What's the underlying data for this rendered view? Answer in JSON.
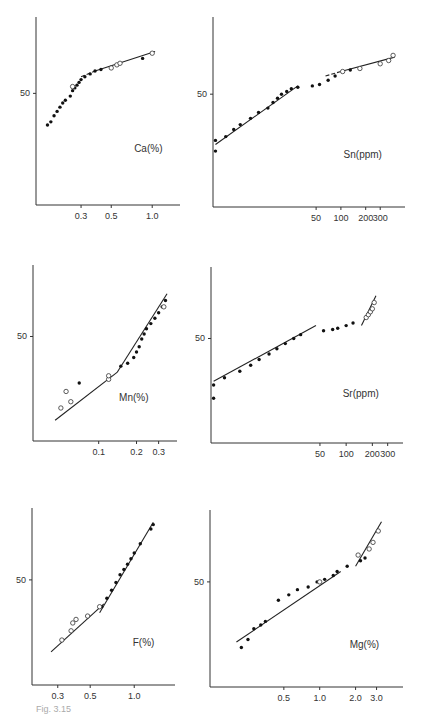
{
  "figure": {
    "caption": "Fig. 3.15"
  },
  "chart_data": [
    {
      "type": "scatter",
      "title": "Ca (%)",
      "label": "Ca(%)",
      "ylabel_tick": "50",
      "xticks": [
        "0.3",
        "0.5",
        "1.0"
      ],
      "xscale": "log",
      "yscale": "probability",
      "points": {
        "filled": [
          [
            0.17,
            28
          ],
          [
            0.18,
            30
          ],
          [
            0.19,
            34
          ],
          [
            0.2,
            37
          ],
          [
            0.21,
            40
          ],
          [
            0.22,
            43
          ],
          [
            0.23,
            45
          ],
          [
            0.25,
            48
          ],
          [
            0.26,
            52
          ],
          [
            0.27,
            54
          ],
          [
            0.28,
            56
          ],
          [
            0.29,
            58
          ],
          [
            0.3,
            60
          ],
          [
            0.32,
            62
          ],
          [
            0.35,
            64
          ],
          [
            0.38,
            66
          ],
          [
            0.42,
            67
          ],
          [
            0.85,
            74
          ]
        ],
        "open": [
          [
            0.26,
            55
          ],
          [
            0.5,
            68
          ],
          [
            0.55,
            70
          ],
          [
            0.58,
            71
          ],
          [
            1.0,
            77
          ]
        ]
      },
      "fit_lines": [
        {
          "from": [
            0.3,
            62
          ],
          "to": [
            0.38,
            66
          ],
          "style": "dashed"
        },
        {
          "from": [
            0.38,
            66
          ],
          "to": [
            1.05,
            78
          ],
          "style": "solid"
        }
      ]
    },
    {
      "type": "scatter",
      "title": "Sn (ppm)",
      "label": "Sn(ppm)",
      "ylabel_tick": "50",
      "xticks": [
        "50",
        "100",
        "200",
        "300"
      ],
      "xscale": "log",
      "yscale": "probability",
      "points": {
        "filled": [
          [
            3,
            15
          ],
          [
            3,
            20
          ],
          [
            4,
            22
          ],
          [
            5,
            26
          ],
          [
            6,
            29
          ],
          [
            8,
            33
          ],
          [
            10,
            37
          ],
          [
            13,
            40
          ],
          [
            15,
            44
          ],
          [
            17,
            47
          ],
          [
            19,
            50
          ],
          [
            22,
            52
          ],
          [
            25,
            54
          ],
          [
            30,
            55
          ],
          [
            45,
            56
          ],
          [
            55,
            57
          ],
          [
            70,
            60
          ],
          [
            85,
            63
          ],
          [
            130,
            67
          ]
        ],
        "open": [
          [
            105,
            66
          ],
          [
            170,
            68
          ],
          [
            300,
            71
          ],
          [
            380,
            73
          ],
          [
            430,
            76
          ]
        ]
      },
      "fit_lines": [
        {
          "from": [
            3,
            18
          ],
          "to": [
            30,
            56
          ],
          "style": "solid"
        },
        {
          "from": [
            65,
            63
          ],
          "to": [
            100,
            66
          ],
          "style": "dashed"
        },
        {
          "from": [
            100,
            66
          ],
          "to": [
            450,
            75
          ],
          "style": "solid"
        }
      ]
    },
    {
      "type": "scatter",
      "title": "Mn (%)",
      "label": "Mn(%)",
      "ylabel_tick": "50",
      "xticks": [
        "0.1",
        "0.2",
        "0.3"
      ],
      "xscale": "log",
      "yscale": "probability",
      "points": {
        "filled": [
          [
            0.07,
            18
          ],
          [
            0.15,
            28
          ],
          [
            0.17,
            30
          ],
          [
            0.19,
            34
          ],
          [
            0.2,
            38
          ],
          [
            0.21,
            42
          ],
          [
            0.22,
            48
          ],
          [
            0.23,
            52
          ],
          [
            0.24,
            56
          ],
          [
            0.26,
            60
          ],
          [
            0.28,
            64
          ],
          [
            0.3,
            68
          ],
          [
            0.32,
            72
          ],
          [
            0.34,
            76
          ]
        ],
        "open": [
          [
            0.05,
            8
          ],
          [
            0.055,
            14
          ],
          [
            0.06,
            10
          ],
          [
            0.12,
            20
          ],
          [
            0.12,
            22
          ],
          [
            0.33,
            72
          ]
        ]
      },
      "fit_lines": [
        {
          "from": [
            0.045,
            5
          ],
          "to": [
            0.14,
            24
          ],
          "style": "solid"
        },
        {
          "from": [
            0.14,
            24
          ],
          "to": [
            0.35,
            80
          ],
          "style": "solid"
        }
      ]
    },
    {
      "type": "scatter",
      "title": "Sr (ppm)",
      "label": "Sr(ppm)",
      "ylabel_tick": "50",
      "xticks": [
        "50",
        "100",
        "200",
        "300"
      ],
      "xscale": "log",
      "yscale": "probability",
      "points": {
        "filled": [
          [
            3,
            12
          ],
          [
            3,
            18
          ],
          [
            4,
            22
          ],
          [
            6,
            26
          ],
          [
            8,
            30
          ],
          [
            10,
            34
          ],
          [
            13,
            38
          ],
          [
            16,
            42
          ],
          [
            20,
            46
          ],
          [
            25,
            50
          ],
          [
            30,
            53
          ],
          [
            55,
            56
          ],
          [
            70,
            57
          ],
          [
            80,
            58
          ],
          [
            100,
            60
          ],
          [
            120,
            62
          ]
        ],
        "open": [
          [
            170,
            66
          ],
          [
            180,
            68
          ],
          [
            190,
            70
          ],
          [
            200,
            72
          ],
          [
            210,
            76
          ]
        ]
      },
      "fit_lines": [
        {
          "from": [
            3,
            20
          ],
          "to": [
            45,
            60
          ],
          "style": "solid"
        },
        {
          "from": [
            150,
            60
          ],
          "to": [
            220,
            80
          ],
          "style": "solid"
        }
      ]
    },
    {
      "type": "scatter",
      "title": "F (%)",
      "label": "F(%)",
      "ylabel_tick": "50",
      "xticks": [
        "0.3",
        "0.5",
        "1.0"
      ],
      "xscale": "log",
      "yscale": "probability",
      "points": {
        "filled": [
          [
            0.6,
            30
          ],
          [
            0.65,
            36
          ],
          [
            0.7,
            42
          ],
          [
            0.75,
            48
          ],
          [
            0.8,
            54
          ],
          [
            0.85,
            58
          ],
          [
            0.9,
            62
          ],
          [
            0.95,
            66
          ],
          [
            1.0,
            70
          ],
          [
            1.1,
            76
          ],
          [
            1.3,
            84
          ],
          [
            1.35,
            86
          ]
        ],
        "open": [
          [
            0.32,
            12
          ],
          [
            0.37,
            16
          ],
          [
            0.38,
            20
          ],
          [
            0.4,
            22
          ],
          [
            0.48,
            24
          ],
          [
            0.58,
            30
          ]
        ]
      },
      "fit_lines": [
        {
          "from": [
            0.27,
            8
          ],
          "to": [
            0.62,
            32
          ],
          "style": "solid"
        },
        {
          "from": [
            0.58,
            26
          ],
          "to": [
            1.35,
            87
          ],
          "style": "solid"
        }
      ]
    },
    {
      "type": "scatter",
      "title": "Mg (%)",
      "label": "Mg(%)",
      "ylabel_tick": "50",
      "xticks": [
        "0.5",
        "1.0",
        "2.0",
        "3.0"
      ],
      "xscale": "log",
      "yscale": "probability",
      "points": {
        "filled": [
          [
            0.22,
            10
          ],
          [
            0.25,
            13
          ],
          [
            0.28,
            18
          ],
          [
            0.32,
            20
          ],
          [
            0.35,
            22
          ],
          [
            0.45,
            36
          ],
          [
            0.55,
            40
          ],
          [
            0.65,
            44
          ],
          [
            0.8,
            46
          ],
          [
            0.95,
            50
          ],
          [
            1.1,
            52
          ],
          [
            1.3,
            55
          ],
          [
            1.4,
            58
          ],
          [
            1.7,
            62
          ],
          [
            2.2,
            66
          ],
          [
            2.4,
            68
          ]
        ],
        "open": [
          [
            1.0,
            50
          ],
          [
            2.1,
            70
          ],
          [
            2.6,
            74
          ],
          [
            2.8,
            78
          ],
          [
            3.1,
            84
          ]
        ]
      },
      "fit_lines": [
        {
          "from": [
            0.2,
            12
          ],
          "to": [
            1.5,
            58
          ],
          "style": "solid"
        },
        {
          "from": [
            2.0,
            62
          ],
          "to": [
            3.3,
            88
          ],
          "style": "solid"
        }
      ]
    }
  ]
}
